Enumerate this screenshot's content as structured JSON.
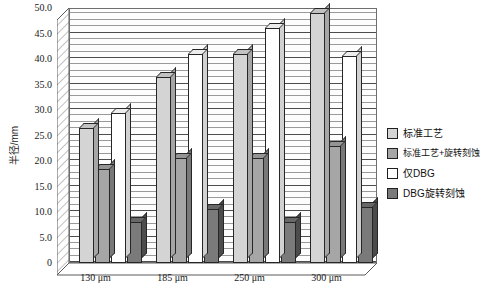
{
  "chart_data": {
    "type": "bar",
    "title": "",
    "subtitle": "",
    "xlabel": "",
    "ylabel": "半径/mm",
    "categories": [
      "130 μm",
      "185 μm",
      "250 μm",
      "300 μm"
    ],
    "series": [
      {
        "name": "标准工艺",
        "color": "#d4d4d4",
        "values": [
          26.5,
          36.5,
          41.0,
          49.0
        ]
      },
      {
        "name": "标准工艺+旋转刻蚀",
        "color": "#a6a6a6",
        "values": [
          18.5,
          20.5,
          20.5,
          23.0
        ]
      },
      {
        "name": "仅DBG",
        "color": "#ffffff",
        "values": [
          29.5,
          41.0,
          46.0,
          40.5
        ]
      },
      {
        "name": "DBG旋转刻蚀",
        "color": "#7a7a7a",
        "values": [
          8.0,
          10.5,
          8.0,
          11.0
        ]
      }
    ],
    "ylim": [
      0,
      50
    ],
    "ytick_step": 5,
    "yticks": [
      "0",
      "5.0",
      "10.0",
      "15.0",
      "20.0",
      "25.0",
      "30.0",
      "35.0",
      "40.0",
      "45.0",
      "50.0"
    ],
    "grid": true,
    "gridlines": "horizontal",
    "legend_position": "right",
    "style": "3d-column"
  },
  "legend": {
    "items": [
      {
        "label": "标准工艺",
        "color": "#d4d4d4"
      },
      {
        "label": "标准工艺+旋转刻蚀",
        "color": "#a6a6a6"
      },
      {
        "label": "仅DBG",
        "color": "#ffffff"
      },
      {
        "label": "DBG旋转刻蚀",
        "color": "#7a7a7a"
      }
    ]
  },
  "axes": {
    "y_title": "半径/mm"
  }
}
